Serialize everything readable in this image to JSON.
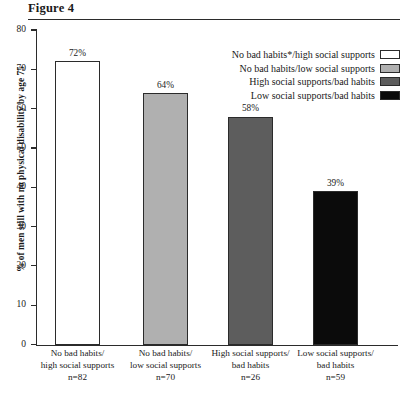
{
  "figure": {
    "title": "Figure 4"
  },
  "chart_data": {
    "type": "bar",
    "title": "Figure 4",
    "xlabel": "",
    "ylabel": "% of men still with no physical disability by age 75",
    "ylim": [
      0,
      80
    ],
    "ytick_labels": [
      "80",
      "70",
      "60",
      "50",
      "40",
      "30",
      "20",
      "10",
      "0"
    ],
    "ytick_values": [
      80,
      70,
      60,
      50,
      40,
      30,
      20,
      10,
      0
    ],
    "grid": false,
    "legend_position": "top-right",
    "categories": [
      "No bad habits/ high social supports",
      "No bad habits/ low social supports",
      "High social supports/ bad habits",
      "Low social supports/ bad habits"
    ],
    "values": [
      72,
      64,
      58,
      39
    ],
    "value_labels": [
      "72%",
      "64%",
      "58%",
      "39%"
    ],
    "bar_colors": [
      "#ffffff",
      "#b0b0b0",
      "#5d5d5d",
      "#0b0b0b"
    ],
    "x_categories": [
      {
        "line1": "No bad habits/",
        "line2": "high social supports",
        "n": "n=82"
      },
      {
        "line1": "No bad habits/",
        "line2": "low social supports",
        "n": "n=70"
      },
      {
        "line1": "High social supports/",
        "line2": "bad habits",
        "n": "n=26"
      },
      {
        "line1": "Low social supports/",
        "line2": "bad habits",
        "n": "n=59"
      }
    ],
    "legend": [
      {
        "label": "No bad habits*/high social supports",
        "color": "#ffffff"
      },
      {
        "label": "No bad habits/low social supports",
        "color": "#b0b0b0"
      },
      {
        "label": "High social supports/bad habits",
        "color": "#5d5d5d"
      },
      {
        "label": "Low social supports/bad habits",
        "color": "#0b0b0b"
      }
    ]
  },
  "footnote": {
    "text": ""
  }
}
